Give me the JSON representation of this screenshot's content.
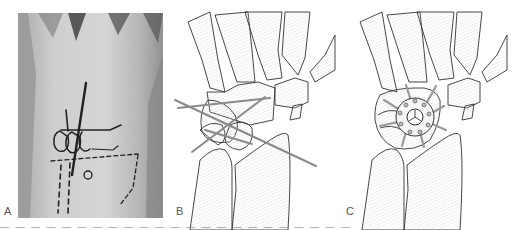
{
  "figure": {
    "panels": [
      {
        "id": "A",
        "label": "A",
        "type": "photograph",
        "subject": "dorsal wrist with surgical skin markings"
      },
      {
        "id": "B",
        "label": "B",
        "type": "line-drawing",
        "subject": "carpal bones with crossing guide lines"
      },
      {
        "id": "C",
        "label": "C",
        "type": "line-drawing",
        "subject": "carpal bones with circular plate and radiating screws"
      }
    ],
    "caption_partial": "— — — — — — — — — — — — — — — — — — — — — — —"
  },
  "colors": {
    "background": "#ffffff",
    "bone_outline": "#333333",
    "bone_fill": "#f1f1f1",
    "hatch": "#dcdcdc",
    "guide_line": "#8a8a8a",
    "photo_skin": "#bdbdbd",
    "marker_ink": "#222222"
  }
}
